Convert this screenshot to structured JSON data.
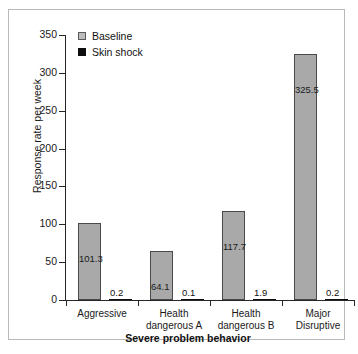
{
  "chart_data": {
    "type": "bar",
    "title": "",
    "xlabel": "Severe problem behavior",
    "ylabel": "Response rate per week",
    "categories": [
      "Aggressive",
      "Health dangerous A",
      "Health dangerous B",
      "Major Disruptive"
    ],
    "category_lines": [
      [
        "Aggressive"
      ],
      [
        "Health",
        "dangerous A"
      ],
      [
        "Health",
        "dangerous B"
      ],
      [
        "Major",
        "Disruptive"
      ]
    ],
    "series": [
      {
        "name": "Baseline",
        "color": "#a9a9a9",
        "values": [
          101.3,
          64.1,
          117.7,
          325.5
        ],
        "labels": [
          "101.3",
          "64.1",
          "117.7",
          "325.5"
        ]
      },
      {
        "name": "Skin shock",
        "color": "#0d0d0d",
        "values": [
          0.2,
          0.1,
          1.9,
          0.2
        ],
        "labels": [
          "0.2",
          "0.1",
          "1.9",
          "0.2"
        ]
      }
    ],
    "ylim": [
      0,
      350
    ],
    "yticks": [
      0,
      50,
      100,
      150,
      200,
      250,
      300,
      350
    ],
    "ytick_labels": [
      "0",
      "50",
      "100",
      "150",
      "200",
      "250",
      "300",
      "350"
    ],
    "grid": false,
    "legend_position": "top-left"
  },
  "legend": {
    "items": [
      {
        "label": "Baseline",
        "swatch": "baseline-swatch"
      },
      {
        "label": "Skin shock",
        "swatch": "skin-shock-swatch"
      }
    ]
  },
  "axes": {
    "y_title": "Response rate per week",
    "x_title": "Severe problem behavior"
  }
}
